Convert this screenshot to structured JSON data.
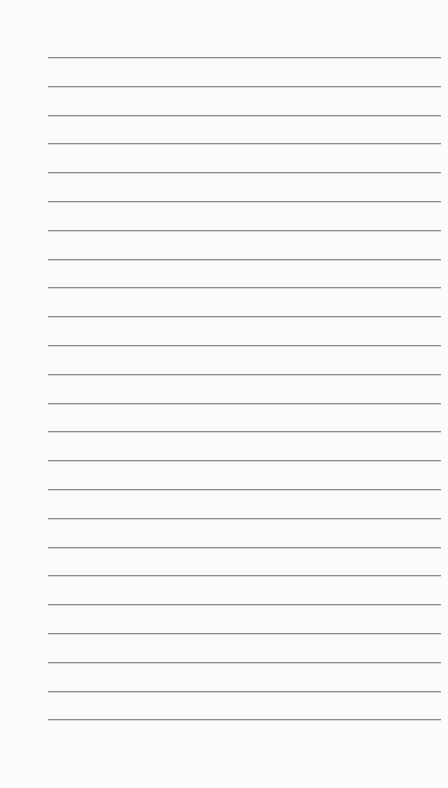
{
  "page": {
    "type": "lined-paper",
    "background": "#fbfbfb",
    "line_color": "#8e8e8e",
    "line_count": 24,
    "first_line_y": 57,
    "line_spacing": 28.8,
    "line_left": 48,
    "line_right": 441
  }
}
